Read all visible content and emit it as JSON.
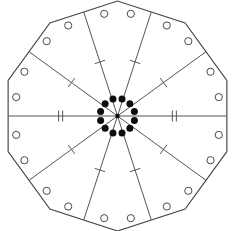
{
  "figure": {
    "type": "geometric-diagram",
    "canvas": {
      "width": 235,
      "height": 231
    },
    "colors": {
      "background": "#ffffff",
      "polygon_stroke": "#444444",
      "spoke_stroke": "#555555",
      "tick_stroke": "#555555",
      "vertex_circle_fill": "#ffffff",
      "vertex_circle_stroke": "#4a4a4a",
      "center_dot_fill": "#0d0d0d"
    },
    "polygon": {
      "sides": 10,
      "name": "decagon",
      "center": {
        "x": 117.5,
        "y": 116.0
      },
      "radius": 115.0,
      "rotation_deg": 18,
      "stroke_width": 1.15
    },
    "spokes": {
      "count": 10,
      "description": "one line from center to each polygon vertex region",
      "stroke_width": 1.0,
      "angles_deg": [
        0,
        36,
        72,
        108,
        144,
        180,
        216,
        252,
        288,
        324
      ]
    },
    "ticks": {
      "description": "hatch marks crossing each spoke at mid-radius",
      "radius_fraction": 0.52,
      "length": 11,
      "items": [
        {
          "spoke": 0,
          "count": 2,
          "style": "double"
        },
        {
          "spoke": 1,
          "count": 1,
          "style": "single"
        },
        {
          "spoke": 2,
          "count": 1,
          "style": "single"
        },
        {
          "spoke": 3,
          "count": 1,
          "style": "single"
        },
        {
          "spoke": 4,
          "count": 1,
          "style": "single"
        },
        {
          "spoke": 5,
          "count": 2,
          "style": "double"
        },
        {
          "spoke": 6,
          "count": 1,
          "style": "single"
        },
        {
          "spoke": 7,
          "count": 1,
          "style": "single"
        },
        {
          "spoke": 8,
          "count": 1,
          "style": "single"
        },
        {
          "spoke": 9,
          "count": 1,
          "style": "single"
        }
      ]
    },
    "vertex_circles": {
      "per_vertex": 2,
      "total": 20,
      "radius": 3.6,
      "inset": 14,
      "offset_spread": 9,
      "filled": false
    },
    "center_ring": {
      "dot_count": 12,
      "dot_radius": 3.5,
      "ring_radius": 17.5,
      "start_angle_deg": 15,
      "filled": true
    },
    "hub": {
      "radius": 2.2,
      "filled": true
    }
  }
}
